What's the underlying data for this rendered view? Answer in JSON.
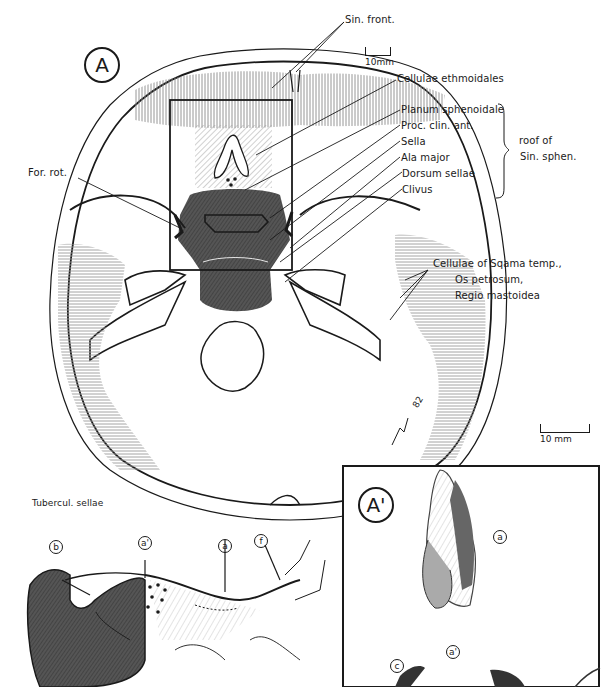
{
  "figure": {
    "panel_main_label": "A",
    "panel_inset_label": "A'",
    "signature": "82"
  },
  "labels": {
    "sin_front": "Sin. front.",
    "cellulae_ethmoidales": "Cellulae ethmoidales",
    "planum_sphenoidale": "Planum sphenoidale",
    "proc_clin_ant": "Proc. clin. ant.",
    "sella": "Sella",
    "ala_major": "Ala major",
    "dorsum_sellae": "Dorsum sellae",
    "clivus": "Clivus",
    "bracket_note_line1": "roof of",
    "bracket_note_line2": "Sin. sphen.",
    "for_rot": "For. rot.",
    "cellulae_temp_line1": "Cellulae of Sqama temp.,",
    "cellulae_temp_line2": "Os petrosum,",
    "cellulae_temp_line3": "Regio mastoidea",
    "tubercul_sellae": "Tubercul. sellae"
  },
  "scale_bars": {
    "top": "10mm",
    "right": "10 mm"
  },
  "markers": {
    "b": "b",
    "a_prime": "a'",
    "a": "a",
    "f": "f",
    "inset_a": "a",
    "inset_a_prime": "a'",
    "inset_c": "c"
  },
  "colors": {
    "ink": "#1a1a1a",
    "dark_fill": "#4a4a4a",
    "hatch_gray": "#9a9a9a",
    "paper": "#ffffff"
  }
}
